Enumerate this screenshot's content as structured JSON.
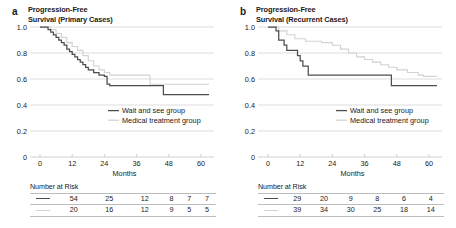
{
  "figure": {
    "panels": [
      {
        "letter": "a",
        "title": "Progression-Free Survival (Primary Cases)",
        "title_line1": "Progression-Free",
        "title_line2": "Survival (Primary Cases)"
      },
      {
        "letter": "b",
        "title": "Progression-Free Survival (Recurrent Cases)",
        "title_line1": "Progression-Free",
        "title_line2": "Survival (Recurrent Cases)"
      }
    ],
    "colors": {
      "wait_and_see": "#4d4d4d",
      "medical_treatment": "#d2d2d2",
      "gridline": "#c8c8c8",
      "axis": "#b4b4b4",
      "text": "#1a1a1a"
    },
    "number_at_risk_label": "Number at Risk"
  },
  "chart_data": [
    {
      "type": "line",
      "title": "Progression-Free Survival (Primary Cases)",
      "panel": "a",
      "xlabel": "Months",
      "ylabel": "",
      "xlim": [
        0,
        63
      ],
      "ylim": [
        0,
        1.0
      ],
      "xticks": [
        0,
        12,
        24,
        36,
        48,
        60
      ],
      "xtick_labels": [
        "0",
        "12",
        "24",
        "36",
        "48",
        "60"
      ],
      "yticks": [
        0,
        0.2,
        0.4,
        0.6,
        0.8,
        1.0
      ],
      "ytick_labels": [
        "0",
        "0.2",
        "0.4",
        "0.6",
        "0.8",
        "1.0"
      ],
      "grid": true,
      "legend_position": "center-bottom",
      "series": [
        {
          "name": "Wait and see group",
          "color": "#4d4d4d",
          "steps": [
            [
              0,
              1.0
            ],
            [
              3,
              0.98
            ],
            [
              4,
              0.96
            ],
            [
              5,
              0.94
            ],
            [
              6,
              0.92
            ],
            [
              7,
              0.9
            ],
            [
              8,
              0.88
            ],
            [
              9,
              0.86
            ],
            [
              10,
              0.83
            ],
            [
              11,
              0.81
            ],
            [
              12,
              0.79
            ],
            [
              13,
              0.77
            ],
            [
              14,
              0.75
            ],
            [
              15,
              0.73
            ],
            [
              16,
              0.71
            ],
            [
              17,
              0.69
            ],
            [
              18,
              0.67
            ],
            [
              20,
              0.65
            ],
            [
              22,
              0.63
            ],
            [
              24,
              0.62
            ],
            [
              25,
              0.56
            ],
            [
              26,
              0.55
            ],
            [
              45,
              0.55
            ],
            [
              46,
              0.48
            ],
            [
              62,
              0.48
            ]
          ]
        },
        {
          "name": "Medical treatment group",
          "color": "#d2d2d2",
          "steps": [
            [
              0,
              1.0
            ],
            [
              4,
              0.98
            ],
            [
              6,
              0.95
            ],
            [
              8,
              0.92
            ],
            [
              10,
              0.88
            ],
            [
              12,
              0.85
            ],
            [
              14,
              0.82
            ],
            [
              16,
              0.78
            ],
            [
              18,
              0.74
            ],
            [
              20,
              0.7
            ],
            [
              22,
              0.67
            ],
            [
              24,
              0.65
            ],
            [
              26,
              0.63
            ],
            [
              40,
              0.63
            ],
            [
              41,
              0.56
            ],
            [
              62,
              0.56
            ]
          ]
        }
      ],
      "number_at_risk": {
        "label": "Number at Risk",
        "times": [
          0,
          12,
          24,
          36,
          48,
          60
        ],
        "rows": [
          {
            "group": "Wait and see group",
            "color": "#4d4d4d",
            "counts": [
              54,
              25,
              12,
              8,
              7,
              7
            ]
          },
          {
            "group": "Medical treatment group",
            "color": "#d2d2d2",
            "counts": [
              20,
              16,
              12,
              9,
              5,
              5
            ]
          }
        ]
      }
    },
    {
      "type": "line",
      "title": "Progression-Free Survival (Recurrent Cases)",
      "panel": "b",
      "xlabel": "Months",
      "ylabel": "",
      "xlim": [
        0,
        63
      ],
      "ylim": [
        0,
        1.0
      ],
      "xticks": [
        0,
        12,
        24,
        36,
        48,
        60
      ],
      "xtick_labels": [
        "0",
        "12",
        "24",
        "36",
        "48",
        "60"
      ],
      "yticks": [
        0,
        0.2,
        0.4,
        0.6,
        0.8,
        1.0
      ],
      "ytick_labels": [
        "0",
        "0.2",
        "0.4",
        "0.6",
        "0.8",
        "1.0"
      ],
      "grid": true,
      "legend_position": "center-bottom",
      "series": [
        {
          "name": "Wait and see group",
          "color": "#4d4d4d",
          "steps": [
            [
              0,
              1.0
            ],
            [
              3,
              0.97
            ],
            [
              4,
              0.9
            ],
            [
              6,
              0.86
            ],
            [
              7,
              0.82
            ],
            [
              10,
              0.82
            ],
            [
              11,
              0.78
            ],
            [
              12,
              0.74
            ],
            [
              13,
              0.7
            ],
            [
              15,
              0.63
            ],
            [
              45,
              0.63
            ],
            [
              46,
              0.55
            ],
            [
              62,
              0.55
            ]
          ]
        },
        {
          "name": "Medical treatment group",
          "color": "#d2d2d2",
          "steps": [
            [
              0,
              1.0
            ],
            [
              4,
              0.97
            ],
            [
              7,
              0.94
            ],
            [
              10,
              0.91
            ],
            [
              14,
              0.89
            ],
            [
              20,
              0.88
            ],
            [
              24,
              0.86
            ],
            [
              27,
              0.83
            ],
            [
              30,
              0.8
            ],
            [
              33,
              0.77
            ],
            [
              36,
              0.75
            ],
            [
              39,
              0.73
            ],
            [
              42,
              0.71
            ],
            [
              45,
              0.69
            ],
            [
              48,
              0.67
            ],
            [
              52,
              0.65
            ],
            [
              56,
              0.63
            ],
            [
              58,
              0.62
            ],
            [
              62,
              0.62
            ]
          ]
        }
      ],
      "number_at_risk": {
        "label": "Number at Risk",
        "times": [
          0,
          12,
          24,
          36,
          48,
          60
        ],
        "rows": [
          {
            "group": "Wait and see group",
            "color": "#4d4d4d",
            "counts": [
              29,
              20,
              9,
              8,
              6,
              4
            ]
          },
          {
            "group": "Medical treatment group",
            "color": "#d2d2d2",
            "counts": [
              39,
              34,
              30,
              25,
              18,
              14
            ]
          }
        ]
      }
    }
  ]
}
